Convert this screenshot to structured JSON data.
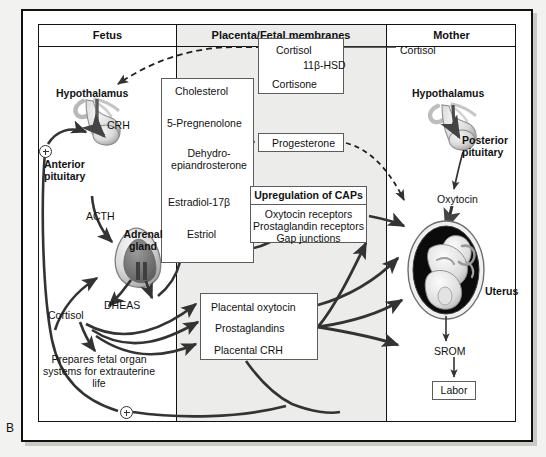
{
  "figure": {
    "panel_label": "B"
  },
  "columns": [
    {
      "id": "fetus",
      "header": "Fetus"
    },
    {
      "id": "placenta",
      "header": "Placenta/Fetal membranes"
    },
    {
      "id": "mother",
      "header": "Mother"
    }
  ],
  "fetus": {
    "hypothalamus": "Hypothalamus",
    "crh": "CRH",
    "anterior_pituitary": "Anterior\npituitary",
    "acth": "ACTH",
    "adrenal_gland": "Adrenal\ngland",
    "dheas": "DHEAS",
    "cortisol": "Cortisol",
    "prepares": "Prepares fetal organ systems for extrauterine life"
  },
  "placenta": {
    "cortisol_box": {
      "input": "Cortisol",
      "enzyme": "11β-HSD",
      "output": "Cortisone"
    },
    "steroid_pathway": [
      "Cholesterol",
      "5-Pregnenolone",
      "Dehydro-\nepiandrosterone",
      "Estradiol-17β",
      "Estriol"
    ],
    "progesterone": "Progesterone",
    "caps_box": {
      "title": "Upregulation of CAPs",
      "items": [
        "Oxytocin receptors",
        "Prostaglandin receptors",
        "Gap junctions"
      ]
    },
    "placental_products": [
      "Placental oxytocin",
      "Prostaglandins",
      "Placental CRH"
    ]
  },
  "mother": {
    "cortisol": "Cortisol",
    "hypothalamus": "Hypothalamus",
    "posterior_pituitary": "Posterior\npituitary",
    "oxytocin": "Oxytocin",
    "uterus": "Uterus",
    "srom": "SROM",
    "labor": "Labor"
  },
  "symbols": {
    "plus": "+"
  },
  "colors": {
    "frame": "#111111",
    "box_border": "#5c5c5c",
    "arrow": "#333333",
    "middle_column_bg": "#ececeb",
    "page_bg": "#f2f2f0",
    "panel_bg": "#ffffff"
  }
}
